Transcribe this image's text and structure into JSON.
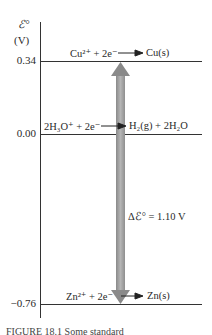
{
  "axis": {
    "symbol": "ℰ°",
    "unit": "(V)"
  },
  "levels": [
    {
      "value_label": "0.34",
      "value": 0.34,
      "reaction_left": "Cu²⁺ + 2e⁻",
      "reaction_right": "Cu(s)"
    },
    {
      "value_label": "0.00",
      "value": 0.0,
      "reaction_left": "2H₃O⁺ + 2e⁻",
      "reaction_right": "H₂(g) + 2H₂O"
    },
    {
      "value_label": "−0.76",
      "value": -0.76,
      "reaction_left": "Zn²⁺ + 2e⁻",
      "reaction_right": "Zn(s)"
    }
  ],
  "difference": {
    "label": "Δℰ° = 1.10 V"
  },
  "caption": "FIGURE 18.1  Some standard"
}
